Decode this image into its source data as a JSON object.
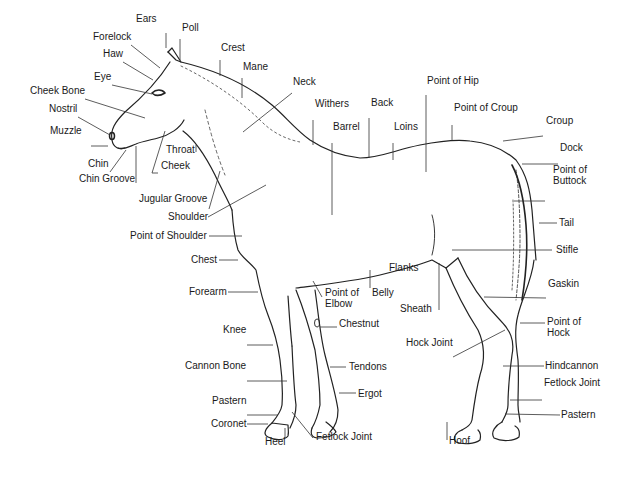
{
  "diagram": {
    "labels": [
      {
        "id": "ears",
        "text": "Ears",
        "x": 136,
        "y": 23
      },
      {
        "id": "poll",
        "text": "Poll",
        "x": 182,
        "y": 32
      },
      {
        "id": "crest",
        "text": "Crest",
        "x": 221,
        "y": 52
      },
      {
        "id": "forelock",
        "text": "Forelock",
        "x": 93,
        "y": 41
      },
      {
        "id": "haw",
        "text": "Haw",
        "x": 103,
        "y": 58
      },
      {
        "id": "mane",
        "text": "Mane",
        "x": 243,
        "y": 71
      },
      {
        "id": "eye",
        "text": "Eye",
        "x": 94,
        "y": 81
      },
      {
        "id": "neck",
        "text": "Neck",
        "x": 293,
        "y": 86
      },
      {
        "id": "cheek-bone",
        "text": "Cheek Bone",
        "x": 30,
        "y": 95
      },
      {
        "id": "withers",
        "text": "Withers",
        "x": 315,
        "y": 108
      },
      {
        "id": "back",
        "text": "Back",
        "x": 371,
        "y": 107
      },
      {
        "id": "point-of-hip",
        "text": "Point of Hip",
        "x": 427,
        "y": 85
      },
      {
        "id": "nostril",
        "text": "Nostril",
        "x": 49,
        "y": 113
      },
      {
        "id": "barrel",
        "text": "Barrel",
        "x": 333,
        "y": 131
      },
      {
        "id": "loins",
        "text": "Loins",
        "x": 394,
        "y": 131
      },
      {
        "id": "point-of-croup",
        "text": "Point of Croup",
        "x": 454,
        "y": 112
      },
      {
        "id": "croup",
        "text": "Croup",
        "x": 546,
        "y": 125
      },
      {
        "id": "muzzle",
        "text": "Muzzle",
        "x": 50,
        "y": 135
      },
      {
        "id": "throat",
        "text": "Throat",
        "x": 166,
        "y": 154
      },
      {
        "id": "dock",
        "text": "Dock",
        "x": 560,
        "y": 152
      },
      {
        "id": "chin",
        "text": "Chin",
        "x": 88,
        "y": 168
      },
      {
        "id": "cheek",
        "text": "Cheek",
        "x": 161,
        "y": 170
      },
      {
        "id": "point-of-buttock",
        "text": "Point of\nButtock",
        "x": 553,
        "y": 174
      },
      {
        "id": "chin-groove",
        "text": "Chin Groove",
        "x": 79,
        "y": 183
      },
      {
        "id": "jugular-groove",
        "text": "Jugular Groove",
        "x": 139,
        "y": 203
      },
      {
        "id": "shoulder",
        "text": "Shoulder",
        "x": 168,
        "y": 221
      },
      {
        "id": "tail",
        "text": "Tail",
        "x": 559,
        "y": 227
      },
      {
        "id": "point-of-shoulder",
        "text": "Point of Shoulder",
        "x": 130,
        "y": 240
      },
      {
        "id": "stifle",
        "text": "Stifle",
        "x": 556,
        "y": 254
      },
      {
        "id": "chest",
        "text": "Chest",
        "x": 191,
        "y": 264
      },
      {
        "id": "flanks",
        "text": "Flanks",
        "x": 389,
        "y": 272
      },
      {
        "id": "gaskin",
        "text": "Gaskin",
        "x": 548,
        "y": 288
      },
      {
        "id": "forearm",
        "text": "Forearm",
        "x": 189,
        "y": 296
      },
      {
        "id": "point-of-elbow",
        "text": "Point of\nElbow",
        "x": 325,
        "y": 297
      },
      {
        "id": "belly",
        "text": "Belly",
        "x": 372,
        "y": 297
      },
      {
        "id": "sheath",
        "text": "Sheath",
        "x": 400,
        "y": 313
      },
      {
        "id": "point-of-hock",
        "text": "Point of\nHock",
        "x": 547,
        "y": 326
      },
      {
        "id": "chestnut",
        "text": "Chestnut",
        "x": 339,
        "y": 328
      },
      {
        "id": "knee",
        "text": "Knee",
        "x": 223,
        "y": 334
      },
      {
        "id": "hock-joint",
        "text": "Hock Joint",
        "x": 406,
        "y": 347
      },
      {
        "id": "tendons",
        "text": "Tendons",
        "x": 349,
        "y": 371
      },
      {
        "id": "cannon-bone",
        "text": "Cannon Bone",
        "x": 185,
        "y": 370
      },
      {
        "id": "hindcannon",
        "text": "Hindcannon",
        "x": 545,
        "y": 370
      },
      {
        "id": "fetlock-joint-hind",
        "text": "Fetlock Joint",
        "x": 544,
        "y": 387
      },
      {
        "id": "ergot",
        "text": "Ergot",
        "x": 358,
        "y": 398
      },
      {
        "id": "pastern-front",
        "text": "Pastern",
        "x": 212,
        "y": 405
      },
      {
        "id": "pastern-hind",
        "text": "Pastern",
        "x": 561,
        "y": 419
      },
      {
        "id": "coronet",
        "text": "Coronet",
        "x": 211,
        "y": 428
      },
      {
        "id": "fetlock-joint-front",
        "text": "Fetlock Joint",
        "x": 316,
        "y": 441
      },
      {
        "id": "heel",
        "text": "Heel",
        "x": 265,
        "y": 446
      },
      {
        "id": "hoof",
        "text": "Hoof",
        "x": 449,
        "y": 445
      }
    ]
  }
}
